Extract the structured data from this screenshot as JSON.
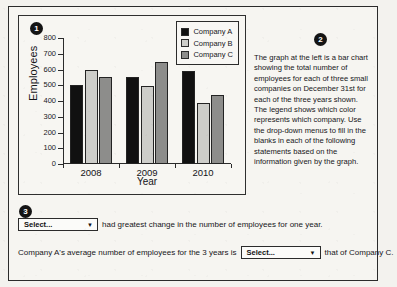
{
  "markers": {
    "one": "1",
    "two": "2",
    "three": "3"
  },
  "chart_data": {
    "type": "bar",
    "title": "",
    "xlabel": "Year",
    "ylabel": "Employees",
    "categories": [
      "2008",
      "2009",
      "2010"
    ],
    "series": [
      {
        "name": "Company A",
        "color": "#111111",
        "values": [
          500,
          550,
          590
        ]
      },
      {
        "name": "Company B",
        "color": "#cdcdc9",
        "values": [
          600,
          495,
          390
        ]
      },
      {
        "name": "Company C",
        "color": "#8d8d8b",
        "values": [
          550,
          645,
          440
        ]
      }
    ],
    "ylim": [
      0,
      800
    ],
    "yticks": [
      0,
      100,
      200,
      300,
      400,
      500,
      600,
      700,
      800
    ],
    "grid": false,
    "legend_position": "top-right"
  },
  "description": {
    "paragraph": "The graph at the left is a bar chart showing the total number of employees for each of three small companies on December 31st for each of the three years shown. The legend shows which color represents which company. Use the drop-down menus to fill in the blanks in each of the following statements based on the information given by the graph."
  },
  "statements": {
    "first": {
      "dropdown_value": "Select...",
      "dropdown_arrow": "▼",
      "trailing_text": "had greatest change in the number of employees for one year."
    },
    "second": {
      "leading_text": "Company A's average number of employees for the 3 years is",
      "dropdown_value": "Select...",
      "dropdown_arrow": "▼",
      "trailing_text": "that of Company C."
    }
  }
}
